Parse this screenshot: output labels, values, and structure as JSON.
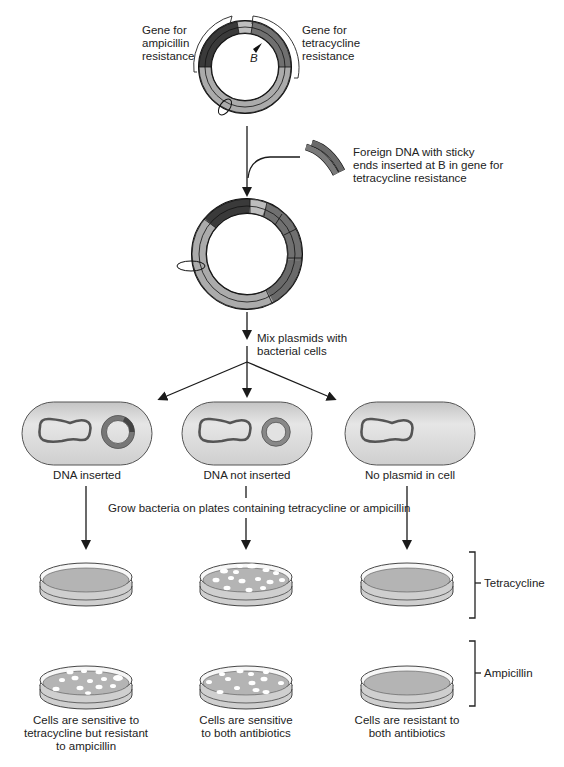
{
  "colors": {
    "ampicillin_gene": "#3a3a3a",
    "tetracycline_gene": "#6e6e6e",
    "plasmid_base": "#ababab",
    "origin_segment": "#bcbcbc",
    "cell_fill": "#d9d9d9",
    "agar_fill": "#b4b4b4",
    "colony_fill": "#ffffff",
    "line": "#1a1a1a"
  },
  "top_plasmid": {
    "label_ampicillin": [
      "Gene for",
      "ampicillin",
      "resistance"
    ],
    "label_tetracycline": [
      "Gene for",
      "tetracycline",
      "resistance"
    ],
    "site_marker": "B"
  },
  "foreign_dna": {
    "label": [
      "Foreign DNA with sticky",
      "ends inserted at B in gene for",
      "tetracycline resistance"
    ]
  },
  "mix_step": {
    "label": [
      "Mix plasmids with",
      "bacterial cells"
    ]
  },
  "cells": [
    {
      "label": "DNA inserted",
      "plasmid": "recombinant"
    },
    {
      "label": "DNA not inserted",
      "plasmid": "original"
    },
    {
      "label": "No plasmid in cell",
      "plasmid": "none"
    }
  ],
  "grow_step": {
    "label": "Grow bacteria on plates containing tetracycline or ampicillin"
  },
  "plate_rows": [
    {
      "label": "Tetracycline",
      "plates": [
        "no colonies",
        "colonies",
        "no colonies"
      ]
    },
    {
      "label": "Ampicillin",
      "plates": [
        "colonies",
        "colonies",
        "no colonies"
      ]
    }
  ],
  "outcomes": [
    {
      "lines": [
        "Cells are sensitive to",
        "tetracycline but resistant",
        "to ampicillin"
      ]
    },
    {
      "lines": [
        "Cells are sensitive",
        "to both antibiotics"
      ]
    },
    {
      "lines": [
        "Cells are resistant to",
        "both antibiotics"
      ]
    }
  ]
}
